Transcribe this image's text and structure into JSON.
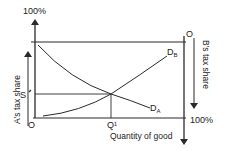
{
  "diagram": {
    "top_left_label": "100%",
    "bottom_right_label": "100%",
    "origin_left": "O",
    "origin_right": "O",
    "q_label": "Q¹",
    "s_label": "S",
    "x_axis_label": "Quantity of good",
    "left_axis_label": "A's tax share",
    "right_axis_label": "B's tax share",
    "curve_a": {
      "label": "D",
      "subscript": "A"
    },
    "curve_b": {
      "label": "D",
      "subscript": "B"
    },
    "colors": {
      "line": "#2a2a2a",
      "text": "#222222",
      "background": "#ffffff"
    }
  }
}
